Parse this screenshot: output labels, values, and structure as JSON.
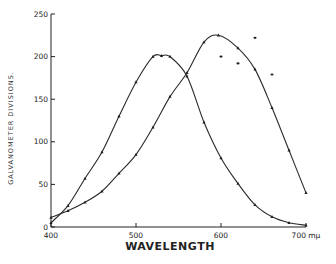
{
  "chart_data": {
    "type": "line",
    "title": "",
    "xlabel": "WAVELENGTH",
    "ylabel": "GALVANOMETER DIVISIONS.",
    "x_unit": "mμ",
    "xlim": [
      400,
      700
    ],
    "ylim": [
      0,
      250
    ],
    "x_ticks": [
      400,
      500,
      600,
      700
    ],
    "x_tick_labels": [
      "400",
      "500",
      "600",
      "700 mμ"
    ],
    "y_ticks": [
      0,
      50,
      100,
      150,
      200,
      250
    ],
    "y_tick_labels": [
      "0",
      "50",
      "100",
      "150",
      "200",
      "250"
    ],
    "grid": false,
    "legend": null,
    "series": [
      {
        "name": "Curve A (peak ~530 mμ)",
        "marker": "triangle",
        "x": [
          400,
          420,
          440,
          460,
          480,
          500,
          520,
          530,
          540,
          560,
          580,
          600,
          620,
          640,
          660,
          680,
          700
        ],
        "values": [
          5,
          25,
          57,
          88,
          130,
          170,
          200,
          201,
          200,
          177,
          123,
          81,
          51,
          26,
          12,
          5,
          2
        ]
      },
      {
        "name": "Curve B (peak ~597 mμ)",
        "marker": "triangle",
        "x": [
          400,
          420,
          440,
          460,
          480,
          500,
          520,
          540,
          560,
          580,
          597,
          620,
          640,
          660,
          680,
          700
        ],
        "values": [
          11,
          19,
          29,
          42,
          63,
          85,
          117,
          153,
          181,
          217,
          225,
          210,
          185,
          140,
          90,
          40
        ]
      },
      {
        "name": "Scattered points",
        "marker": "dot",
        "x": [
          600,
          620,
          640,
          660
        ],
        "values": [
          200,
          192,
          222,
          179
        ]
      }
    ]
  }
}
